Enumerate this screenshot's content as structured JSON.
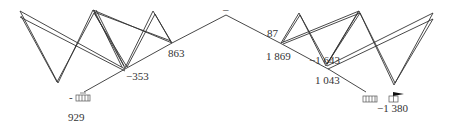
{
  "diagram": {
    "line_color": "#333333",
    "labels": [
      {
        "id": "left-bottom",
        "text": "929",
        "x": 68,
        "y": 121
      },
      {
        "id": "left-dash",
        "text": "-",
        "x": 69,
        "y": 101
      },
      {
        "id": "neg-353",
        "text": "−353",
        "x": 126,
        "y": 80
      },
      {
        "id": "v-863",
        "text": "863",
        "x": 168,
        "y": 57
      },
      {
        "id": "top-dash",
        "text": "–",
        "x": 226,
        "y": 16
      },
      {
        "id": "v-87",
        "text": "87",
        "x": 267,
        "y": 37
      },
      {
        "id": "v-1869",
        "text": "1 869",
        "x": 266,
        "y": 60
      },
      {
        "id": "neg-1643",
        "text": "−1 643",
        "x": 309,
        "y": 64
      },
      {
        "id": "v-1043",
        "text": "1 043",
        "x": 315,
        "y": 84
      },
      {
        "id": "neg-1380",
        "text": "−1 380",
        "x": 377,
        "y": 112
      }
    ]
  }
}
